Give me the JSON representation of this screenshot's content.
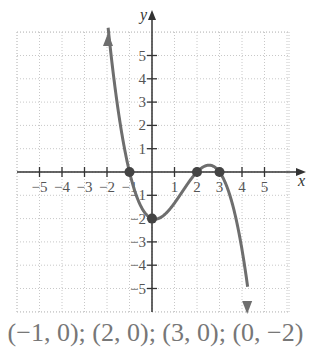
{
  "chart_data": {
    "type": "line",
    "title": "",
    "xlabel": "x",
    "ylabel": "y",
    "xlim": [
      -6,
      6
    ],
    "ylim": [
      -6,
      6
    ],
    "grid": true,
    "x_ticks": [
      -5,
      -4,
      -3,
      -2,
      -1,
      1,
      2,
      3,
      4,
      5
    ],
    "y_ticks": [
      5,
      4,
      3,
      2,
      1,
      -1,
      -2,
      -3,
      -4,
      -5
    ],
    "x_tick_labels": [
      "−5",
      "−4",
      "−3",
      "−2",
      "−1",
      "1",
      "2",
      "3",
      "4",
      "5"
    ],
    "y_tick_labels": [
      "5",
      "4",
      "3",
      "2",
      "1",
      "−1",
      "−2",
      "−3",
      "−4",
      "−5"
    ],
    "series": [
      {
        "name": "polynomial curve",
        "description": "Degree-4 polynomial with zeros at -1, 2, 3, y-intercept -2; arrows indicate both ends continue (left end up, right end down)",
        "points": [
          [
            -1.9,
            6
          ],
          [
            -1,
            0
          ],
          [
            0,
            -2
          ],
          [
            2,
            0
          ],
          [
            2.5,
            0.3
          ],
          [
            3,
            0
          ],
          [
            4.2,
            -6
          ]
        ]
      }
    ],
    "marked_points": [
      {
        "x": -1,
        "y": 0
      },
      {
        "x": 2,
        "y": 0
      },
      {
        "x": 3,
        "y": 0
      },
      {
        "x": 0,
        "y": -2
      }
    ],
    "curve_color": "#6e6e6e",
    "caption": "(−1, 0); (2, 0); (3, 0); (0, −2)"
  }
}
